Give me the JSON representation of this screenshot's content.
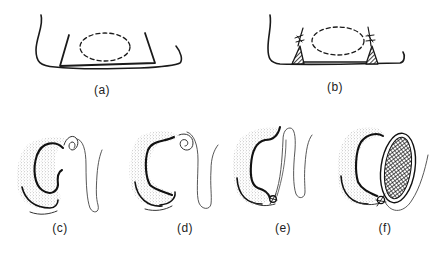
{
  "figure": {
    "panels": [
      {
        "id": "a",
        "label": "(a)",
        "description": "Cavity outline with trapezoidal incision and dashed oval"
      },
      {
        "id": "b",
        "label": "(b)",
        "description": "Cavity with sutured hatched triangular flaps and dashed oval"
      },
      {
        "id": "c",
        "label": "(c)",
        "description": "C-shaped stippled structure with folded flap"
      },
      {
        "id": "d",
        "label": "(d)",
        "description": "C-shaped stippled structure with coiled flap"
      },
      {
        "id": "e",
        "label": "(e)",
        "description": "C-shaped structure with flap sutured at base"
      },
      {
        "id": "f",
        "label": "(f)",
        "description": "C-shaped structure with cross-hatched oval filling, sutured"
      }
    ]
  },
  "colors": {
    "ink": "#1a1a1a",
    "stipple": "#b8b8b8",
    "background": "#ffffff"
  }
}
